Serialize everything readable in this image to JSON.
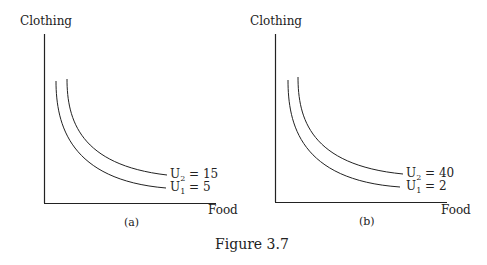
{
  "panels": [
    {
      "id": "a",
      "caption": "(a)",
      "y_axis_label": "Clothing",
      "x_axis_label": "Food",
      "curves": [
        {
          "name": "U",
          "sub": "2",
          "value": "= 15"
        },
        {
          "name": "U",
          "sub": "1",
          "value": "= 5"
        }
      ]
    },
    {
      "id": "b",
      "caption": "(b)",
      "y_axis_label": "Clothing",
      "x_axis_label": "Food",
      "curves": [
        {
          "name": "U",
          "sub": "2",
          "value": "= 40"
        },
        {
          "name": "U",
          "sub": "1",
          "value": "= 2"
        }
      ]
    }
  ],
  "figure_caption": "Figure 3.7",
  "colors": {
    "line": "#222222",
    "background": "#ffffff"
  }
}
